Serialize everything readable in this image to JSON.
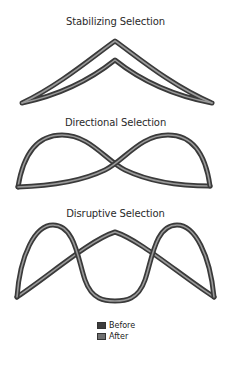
{
  "figure": {
    "panels": [
      {
        "id": "stabilizing",
        "title": "Stabilizing Selection"
      },
      {
        "id": "directional",
        "title": "Directional Selection"
      },
      {
        "id": "disruptive",
        "title": "Disruptive Selection"
      }
    ],
    "legend": {
      "items": [
        {
          "label": "Before",
          "color": "#3d3d3d"
        },
        {
          "label": "After",
          "color": "#707070"
        }
      ]
    },
    "colors": {
      "tube_outline": "#3a3a3a",
      "tube_highlight": "#9a9a9a",
      "background": "#ffffff"
    }
  }
}
